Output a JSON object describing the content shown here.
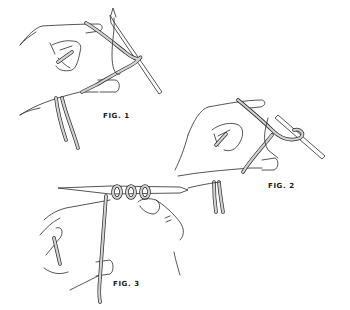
{
  "diagram": {
    "colors": {
      "line": "#2a2a2a",
      "yarn_fill": "#d2d2d2",
      "background": "#ffffff"
    },
    "figures": [
      {
        "id": "fig1",
        "label": "FIG. 1",
        "description": "Left hand wraps yarn around thumb and index finger, needle pointing up-right"
      },
      {
        "id": "fig2",
        "label": "FIG. 2",
        "description": "Needle picks up loop from thumb with yarn wrapped over index finger"
      },
      {
        "id": "fig3",
        "label": "FIG. 3",
        "description": "Two hands holding horizontal needle with three cast-on loops"
      }
    ]
  }
}
